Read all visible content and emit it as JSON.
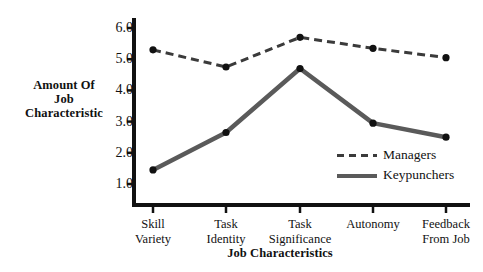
{
  "chart_data": {
    "type": "line",
    "title": "",
    "xlabel": "Job Characteristics",
    "ylabel": "Amount Of Job Characteristic",
    "categories": [
      "Skill Variety",
      "Task Identity",
      "Task Significance",
      "Autonomy",
      "Feedback From Job"
    ],
    "category_lines": [
      [
        "Skill",
        "Variety"
      ],
      [
        "Task",
        "Identity"
      ],
      [
        "Task",
        "Significance"
      ],
      [
        "Autonomy",
        ""
      ],
      [
        "Feedback",
        "From Job"
      ]
    ],
    "series": [
      {
        "name": "Managers",
        "values": [
          5.3,
          4.75,
          5.7,
          5.35,
          5.05
        ],
        "style": "dashed",
        "color": "#3b3b3b"
      },
      {
        "name": "Keypunchers",
        "values": [
          1.45,
          2.65,
          4.7,
          2.95,
          2.5
        ],
        "style": "solid",
        "color": "#5a5a5a"
      }
    ],
    "ylim": [
      0.7,
      6.3
    ],
    "yticks": [
      1.0,
      2.0,
      3.0,
      4.0,
      5.0,
      6.0
    ],
    "ytick_labels": [
      "1.0",
      "2.0",
      "3.0",
      "4.0",
      "5.0",
      "6.0"
    ],
    "grid": false,
    "legend_position": "inside-lower-right"
  },
  "axis_titles": {
    "y_line1": "Amount Of",
    "y_line2": "Job",
    "y_line3": "Characteristic",
    "x": "Job Characteristics"
  },
  "legend": {
    "entries": [
      {
        "label": "Managers"
      },
      {
        "label": "Keypunchers"
      }
    ]
  },
  "colors": {
    "background": "#ffffff",
    "axis": "#111111",
    "managers_line": "#3b3b3b",
    "keypunchers_line": "#5a5a5a",
    "marker": "#111111",
    "text": "#111111"
  }
}
